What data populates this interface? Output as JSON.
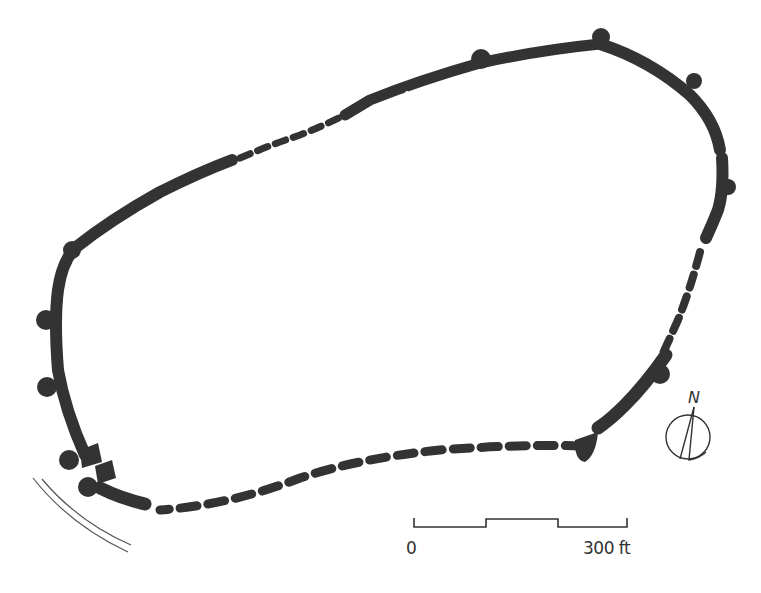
{
  "diagram": {
    "type": "site-plan",
    "wall_color": "#333333",
    "background": "#ffffff",
    "legend": {
      "solid_wall": "surviving wall",
      "dashed_wall": "conjectural / lost wall line"
    }
  },
  "scale_bar": {
    "start_label": "0",
    "end_label": "300 ft"
  },
  "north_arrow": {
    "label": "N"
  }
}
